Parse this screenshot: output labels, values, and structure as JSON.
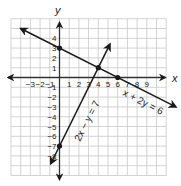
{
  "chart_data": {
    "type": "line",
    "title": "",
    "xlabel": "x",
    "ylabel": "y",
    "xlim": [
      -5,
      11
    ],
    "ylim": [
      -10,
      6
    ],
    "grid": true,
    "x_ticks": [
      "-3",
      "-2",
      "-1",
      "1",
      "2",
      "3",
      "4",
      "5",
      "6",
      "7",
      "8",
      "9"
    ],
    "y_ticks": [
      "4",
      "3",
      "2",
      "1",
      "-1",
      "-2",
      "-3",
      "-4",
      "-5",
      "-6",
      "-7",
      "-8"
    ],
    "series": [
      {
        "name": "x + 2y = 6",
        "label": "x + 2y = 6",
        "points": [
          [
            -4,
            5
          ],
          [
            12,
            -3
          ]
        ],
        "marked_points": [
          [
            0,
            3
          ],
          [
            6,
            0
          ]
        ]
      },
      {
        "name": "2x - y = 7",
        "label": "2x − y = 7",
        "points": [
          [
            -0.9,
            -8.8
          ],
          [
            5.2,
            3.4
          ]
        ],
        "marked_points": [
          [
            0,
            -7
          ]
        ]
      }
    ],
    "intersection": [
      4,
      1
    ]
  },
  "labels": {
    "x_axis": "x",
    "y_axis": "y",
    "line1": "x + 2y = 6",
    "line2": "2x − y = 7"
  },
  "ticks": {
    "x": [
      {
        "v": -3,
        "t": "−3"
      },
      {
        "v": -2,
        "t": "−2"
      },
      {
        "v": -1,
        "t": "−1"
      },
      {
        "v": 1,
        "t": "1"
      },
      {
        "v": 2,
        "t": "2"
      },
      {
        "v": 3,
        "t": "3"
      },
      {
        "v": 4,
        "t": "4"
      },
      {
        "v": 5,
        "t": "5"
      },
      {
        "v": 6,
        "t": "6"
      },
      {
        "v": 7,
        "t": "7"
      },
      {
        "v": 8,
        "t": "8"
      },
      {
        "v": 9,
        "t": "9"
      }
    ],
    "y": [
      {
        "v": 4,
        "t": "4"
      },
      {
        "v": 3,
        "t": "3"
      },
      {
        "v": 2,
        "t": "2"
      },
      {
        "v": 1,
        "t": "1"
      },
      {
        "v": -1,
        "t": "−1"
      },
      {
        "v": -2,
        "t": "−2"
      },
      {
        "v": -3,
        "t": "−3"
      },
      {
        "v": -4,
        "t": "−4"
      },
      {
        "v": -5,
        "t": "−5"
      },
      {
        "v": -6,
        "t": "−6"
      },
      {
        "v": -7,
        "t": "−7"
      },
      {
        "v": -8,
        "t": "−8"
      }
    ]
  },
  "colors": {
    "grid": "#c8c8c8",
    "axis": "#333333",
    "line": "#1a1a1a",
    "text": "#222222"
  }
}
